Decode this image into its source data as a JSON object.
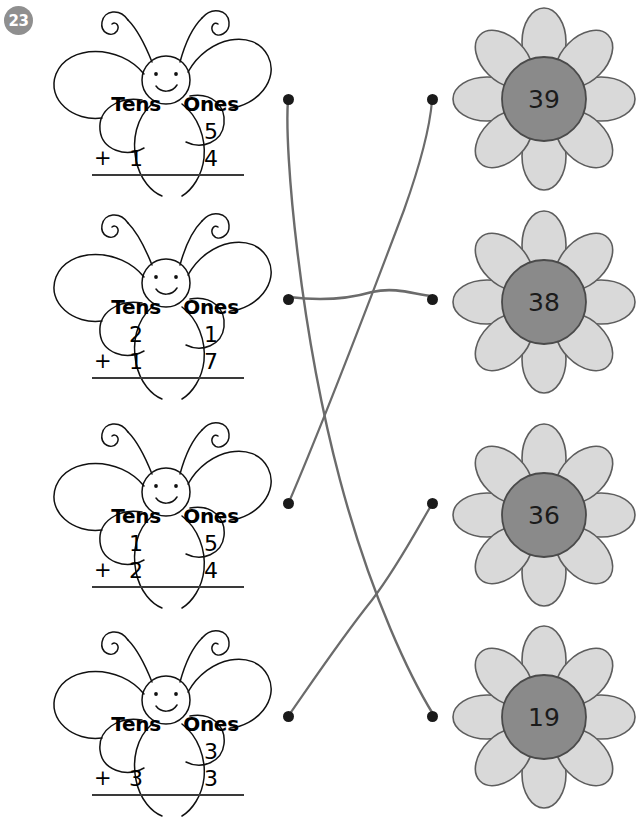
{
  "page": {
    "number": "23"
  },
  "worksheet": {
    "columns": {
      "tens": "Tens",
      "ones": "Ones"
    },
    "plus_sign": "+"
  },
  "problems": [
    {
      "id": "problem-1",
      "top_tens": "",
      "top_ones": "5",
      "add_tens": "1",
      "add_ones": "4",
      "answer": "19"
    },
    {
      "id": "problem-2",
      "top_tens": "2",
      "top_ones": "1",
      "add_tens": "1",
      "add_ones": "7",
      "answer": "38"
    },
    {
      "id": "problem-3",
      "top_tens": "1",
      "top_ones": "5",
      "add_tens": "2",
      "add_ones": "4",
      "answer": "39"
    },
    {
      "id": "problem-4",
      "top_tens": "",
      "top_ones": "3",
      "add_tens": "3",
      "add_ones": "3",
      "answer": "36"
    }
  ],
  "answers": [
    {
      "id": "flower-1",
      "value": "39"
    },
    {
      "id": "flower-2",
      "value": "38"
    },
    {
      "id": "flower-3",
      "value": "36"
    },
    {
      "id": "flower-4",
      "value": "19"
    }
  ],
  "matches": [
    {
      "from_row": 1,
      "to_row": 4
    },
    {
      "from_row": 2,
      "to_row": 2
    },
    {
      "from_row": 3,
      "to_row": 1
    },
    {
      "from_row": 4,
      "to_row": 3
    }
  ],
  "colors": {
    "badge": "#8f8f8f",
    "petal": "#d9d9d9",
    "petal_outline": "#5d5d5d",
    "center": "#8a8a8a",
    "center_outline": "#4a4a4a",
    "line": "#6b6b6b",
    "dot": "#1a1a1a",
    "ink": "#000000"
  }
}
